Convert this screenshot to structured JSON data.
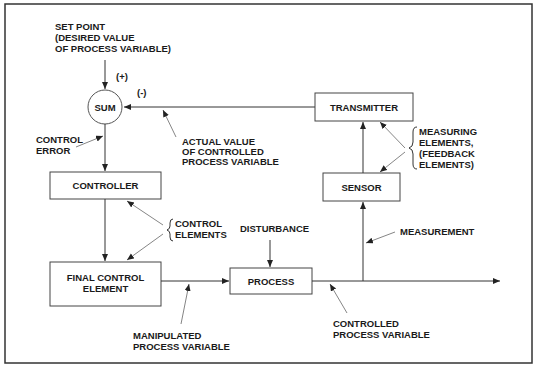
{
  "diagram": {
    "colors": {
      "line": "#333333",
      "box_border": "#444444",
      "pointer": "#777777",
      "frame": "#333333",
      "text": "#1a1a1a"
    },
    "blocks": {
      "sum": "SUM",
      "controller": "CONTROLLER",
      "final_control_line1": "FINAL CONTROL",
      "final_control_line2": "ELEMENT",
      "process": "PROCESS",
      "sensor": "SENSOR",
      "transmitter": "TRANSMITTER"
    },
    "signs": {
      "plus": "(+)",
      "minus": "(-)"
    },
    "labels": {
      "set_point": [
        "SET POINT",
        "(DESIRED VALUE",
        " OF PROCESS VARIABLE)"
      ],
      "control_error": [
        "CONTROL",
        "ERROR"
      ],
      "actual_value": [
        "ACTUAL VALUE",
        "OF CONTROLLED",
        "PROCESS VARIABLE"
      ],
      "measuring_elements": [
        "MEASURING",
        "ELEMENTS,",
        "(FEEDBACK",
        " ELEMENTS)"
      ],
      "control_elements": [
        "CONTROL",
        "ELEMENTS"
      ],
      "disturbance": "DISTURBANCE",
      "measurement": "MEASUREMENT",
      "manipulated": [
        "MANIPULATED",
        "PROCESS VARIABLE"
      ],
      "controlled": [
        "CONTROLLED",
        "PROCESS VARIABLE"
      ]
    }
  }
}
